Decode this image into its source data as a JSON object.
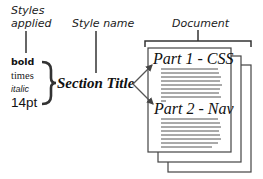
{
  "labels": {
    "styles_applied_line1": "Styles",
    "styles_applied_line2": "applied",
    "style_name": "Style name",
    "document": "Document"
  },
  "styles": {
    "bold": "bold",
    "times": "times",
    "italic": "italic",
    "size": "14pt"
  },
  "section_title": "Section Title",
  "document": {
    "part1_title": "Part 1 - CSS",
    "part2_title": "Part 2 - Nav"
  },
  "colors": {
    "line": "#333333",
    "text": "#111111"
  }
}
